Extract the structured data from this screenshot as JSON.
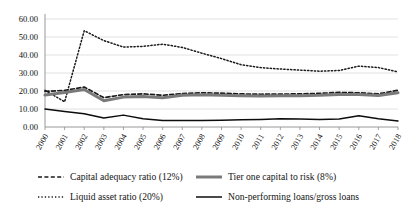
{
  "chart_data": {
    "type": "line",
    "title": "",
    "xlabel": "",
    "ylabel": "",
    "grid": true,
    "legend_position": "bottom",
    "ylim": [
      0,
      60
    ],
    "yticks": [
      "0.00",
      "10.00",
      "20.00",
      "30.00",
      "40.00",
      "50.00",
      "60.00"
    ],
    "ytick_values": [
      0,
      10,
      20,
      30,
      40,
      50,
      60
    ],
    "categories": [
      "2000",
      "2001",
      "2002",
      "2003",
      "2004",
      "2005",
      "2006",
      "2007",
      "2008",
      "2009",
      "2010",
      "2011",
      "2012",
      "2013",
      "2014",
      "2015",
      "2016",
      "2017",
      "2018"
    ],
    "series": [
      {
        "name": "Capital adequacy ratio (12%)",
        "style": "dashed",
        "color": "#1a1a1a",
        "width": 1.7,
        "values": [
          19.8,
          20.3,
          22.2,
          16.3,
          18.0,
          18.4,
          17.6,
          18.6,
          19.0,
          18.8,
          18.4,
          18.2,
          18.3,
          18.4,
          18.7,
          19.2,
          19.0,
          18.4,
          20.4
        ]
      },
      {
        "name": "Tier one capital to risk (8%)",
        "style": "solid-thick",
        "color": "#7a7a7a",
        "width": 3.0,
        "values": [
          17.8,
          19.2,
          20.8,
          14.6,
          16.6,
          17.0,
          16.3,
          17.6,
          17.9,
          17.7,
          17.4,
          17.2,
          17.3,
          17.4,
          17.6,
          18.1,
          18.0,
          17.5,
          19.0
        ]
      },
      {
        "name": "Liquid asset ratio (20%)",
        "style": "dotted",
        "color": "#1a1a1a",
        "width": 1.5,
        "values": [
          20.4,
          14.0,
          53.5,
          48.0,
          44.4,
          44.8,
          46.0,
          44.2,
          41.0,
          38.0,
          34.6,
          33.0,
          32.2,
          31.6,
          31.0,
          31.4,
          33.8,
          33.0,
          30.6
        ]
      },
      {
        "name": "Non-performing loans/gross loans",
        "style": "solid-thin",
        "color": "#0d0d0d",
        "width": 1.5,
        "values": [
          10.0,
          8.6,
          7.4,
          5.0,
          6.6,
          4.6,
          3.6,
          3.6,
          3.6,
          3.8,
          4.0,
          4.2,
          4.6,
          4.4,
          4.2,
          4.4,
          6.2,
          4.6,
          3.4
        ]
      }
    ]
  },
  "legend": {
    "entries": [
      {
        "label": "Capital adequacy ratio (12%)",
        "marker": "dashed-line-marker"
      },
      {
        "label": "Tier one capital to risk (8%)",
        "marker": "thick-gray-line-marker"
      },
      {
        "label": "Liquid asset ratio (20%)",
        "marker": "dotted-line-marker"
      },
      {
        "label": "Non-performing loans/gross loans",
        "marker": "thin-black-line-marker"
      }
    ]
  }
}
